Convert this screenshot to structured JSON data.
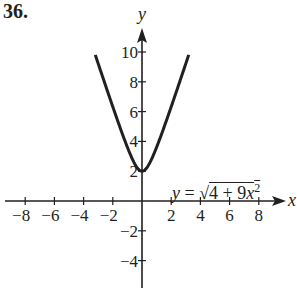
{
  "problem_number": "36.",
  "equation": {
    "lhs": "y",
    "eq": " = ",
    "radical": "√",
    "radicand_const": "4 + 9",
    "radicand_var": "x",
    "radicand_exp": "2"
  },
  "colors": {
    "ink": "#231f20",
    "background": "#ffffff"
  },
  "chart_data": {
    "type": "line",
    "title": "36.",
    "xlabel": "x",
    "ylabel": "y",
    "xlim": [
      -9.5,
      9.5
    ],
    "ylim": [
      -5.5,
      11.5
    ],
    "x_ticks": [
      -8,
      -6,
      -4,
      -2,
      2,
      4,
      6,
      8
    ],
    "x_tick_labels": [
      "−8",
      "−6",
      "−4",
      "−2",
      "2",
      "4",
      "6",
      "8"
    ],
    "y_ticks": [
      -4,
      -2,
      2,
      4,
      6,
      8,
      10
    ],
    "y_tick_labels": [
      "−4",
      "−2",
      "2",
      "4",
      "6",
      "8",
      "10"
    ],
    "grid": false,
    "series": [
      {
        "name": "y = √(4 + 9x²)",
        "x": [
          -3.2,
          -3,
          -2.5,
          -2,
          -1.5,
          -1,
          -0.5,
          0,
          0.5,
          1,
          1.5,
          2,
          2.5,
          3,
          3.2
        ],
        "y": [
          9.81,
          9.22,
          7.76,
          6.32,
          5.0,
          3.61,
          2.5,
          2.0,
          2.5,
          3.61,
          5.0,
          6.32,
          7.76,
          9.22,
          9.81
        ]
      }
    ],
    "annotations": [
      {
        "text": "y = √(4 + 9x²)",
        "x": 3.5,
        "y": 3
      }
    ]
  }
}
